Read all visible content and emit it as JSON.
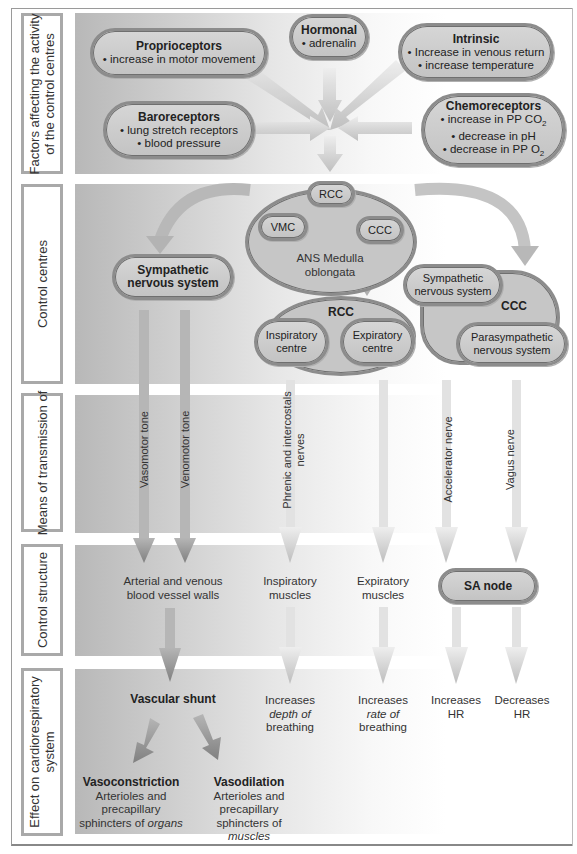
{
  "rows": [
    {
      "id": "factors",
      "label": "Factors affecting the activity of the control centres",
      "label_lines": [
        "Factors affecting the activity",
        "of the control centres"
      ]
    },
    {
      "id": "control_centres",
      "label": "Control centres"
    },
    {
      "id": "transmission",
      "label": "Means of transmission of"
    },
    {
      "id": "control_structure",
      "label": "Control structure"
    },
    {
      "id": "effect",
      "label": "Effect on cardiorespiratory system",
      "label_lines": [
        "Effect on cardiorespiratory",
        "system"
      ]
    }
  ],
  "factors": {
    "proprioceptors": {
      "title": "Proprioceptors",
      "items": [
        "• increase in motor movement"
      ]
    },
    "hormonal": {
      "title": "Hormonal",
      "items": [
        "• adrenalin"
      ]
    },
    "intrinsic": {
      "title": "Intrinsic",
      "items": [
        "• Increase in venous return",
        "• increase temperature"
      ]
    },
    "baroreceptors": {
      "title": "Baroreceptors",
      "items": [
        "• lung stretch receptors",
        "• blood pressure"
      ]
    },
    "chemoreceptors": {
      "title": "Chemoreceptors",
      "items": [
        "• increase in PP CO",
        "• decrease in pH",
        "• decrease in PP O"
      ],
      "subscripts": [
        "2",
        "",
        "2"
      ]
    }
  },
  "control_centres": {
    "medulla": {
      "label": "ANS Medulla",
      "label2": "oblongata",
      "rcc": "RCC",
      "vmc": "VMC",
      "ccc": "CCC"
    },
    "sympathetic": {
      "line1": "Sympathetic",
      "line2": "nervous system"
    },
    "rcc_group": {
      "title": "RCC",
      "inspiratory": [
        "Inspiratory",
        "centre"
      ],
      "expiratory": [
        "Expiratory",
        "centre"
      ]
    },
    "ccc_group": {
      "title": "CCC",
      "sympathetic": [
        "Sympathetic",
        "nervous system"
      ],
      "parasympathetic": [
        "Parasympathetic",
        "nervous system"
      ]
    }
  },
  "transmission": {
    "vasomotor": "Vasomotor tone",
    "venomotor": "Venomotor tone",
    "phrenic": [
      "Phrenic and intercostals",
      "nerves"
    ],
    "accelerator": "Accelerator nerve",
    "vagus": "Vagus nerve"
  },
  "control_structure": {
    "vessels": [
      "Arterial and venous",
      "blood vessel walls"
    ],
    "inspiratory": [
      "Inspiratory",
      "muscles"
    ],
    "expiratory": [
      "Expiratory",
      "muscles"
    ],
    "sa_node": "SA node"
  },
  "effect": {
    "vascular_shunt": "Vascular shunt",
    "depth": {
      "l1": "Increases",
      "l2": "depth of",
      "l3": "breathing"
    },
    "rate": {
      "l1": "Increases",
      "l2": "rate of",
      "l3": "breathing"
    },
    "inc_hr": {
      "l1": "Increases",
      "l2": "HR"
    },
    "dec_hr": {
      "l1": "Decreases",
      "l2": "HR"
    },
    "vasoconstriction": {
      "title": "Vasoconstriction",
      "l1": "Arterioles and",
      "l2": "precapillary",
      "l3": "sphincters of ",
      "em": "organs"
    },
    "vasodilation": {
      "title": "Vasodilation",
      "l1": "Arterioles and",
      "l2": "precapillary",
      "l3": "sphincters of ",
      "em": "muscles"
    }
  },
  "colors": {
    "band_dark": "#b8b8b8",
    "pill_fill": "#c9c9c9",
    "pill_border": "#8c8c8c",
    "arrow_dark": "#8a8a8a",
    "arrow_light": "#dddddd"
  }
}
